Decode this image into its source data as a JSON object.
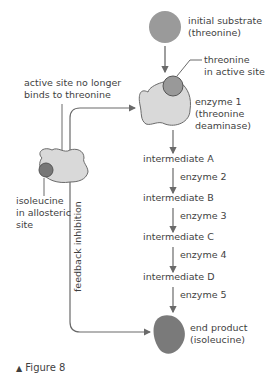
{
  "diagram": {
    "initial_substrate": {
      "line1": "initial substrate",
      "line2": "(threonine)"
    },
    "threonine_active_site": {
      "line1": "threonine",
      "line2": "in active site"
    },
    "enzyme1": {
      "line1": "enzyme 1",
      "line2": "(threonine",
      "line3": "deaminase)"
    },
    "inactive_label": {
      "line1": "active site no longer",
      "line2": "binds to threonine"
    },
    "allosteric_label": {
      "line1": "isoleucine",
      "line2": "in allosteric",
      "line3": "site"
    },
    "feedback": "feedback inhibition",
    "steps": [
      {
        "intermediate": "intermediate A",
        "enzyme": "enzyme 2"
      },
      {
        "intermediate": "intermediate B",
        "enzyme": "enzyme 3"
      },
      {
        "intermediate": "intermediate C",
        "enzyme": "enzyme 4"
      },
      {
        "intermediate": "intermediate D",
        "enzyme": "enzyme 5"
      }
    ],
    "end_product": {
      "line1": "end product",
      "line2": "(isoleucine)"
    },
    "colors": {
      "substrate": "#9a9a9a",
      "enzyme": "#d9d9d9",
      "product": "#7a7a7a",
      "line": "#6a6a6a"
    }
  },
  "caption": {
    "marker": "▲",
    "text": "Figure 8"
  }
}
